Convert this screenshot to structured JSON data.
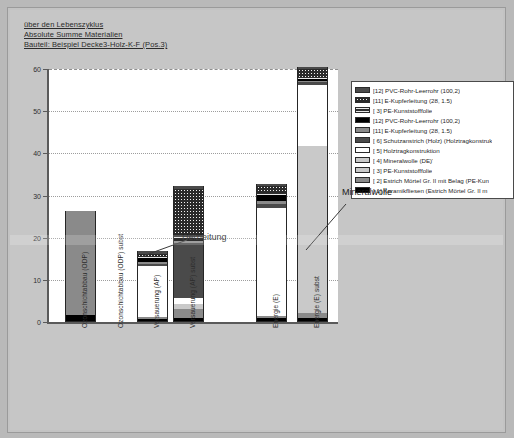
{
  "titles": [
    "über den Lebenszyklus",
    "Absolute Summe Materialien",
    "Bauteil: Beispiel Decke3-Holz-K-F (Pos.3)"
  ],
  "annotations": {
    "heizleitung": "Heizleitung",
    "mineralwolle": "Mineralwolle"
  },
  "legend": {
    "items": [
      {
        "label": "[12] PVC-Rohr-Leerrohr (100,2)",
        "fill": "f-dkgray"
      },
      {
        "label": "[11] E-Kupferleitung (28, 1.5)",
        "fill": "f-dots"
      },
      {
        "label": "[ 3] PE-Kunststofffolie",
        "fill": "f-hlines"
      },
      {
        "label": "[12] PVC-Rohr-Leerrohr (100,2)",
        "fill": "f-black"
      },
      {
        "label": "[11] E-Kupferleitung (28, 1.5)",
        "fill": "f-mgray"
      },
      {
        "label": "[ 6] Schutzanstrich (Holz) (Holztragkonstruk",
        "fill": "f-dkgray"
      },
      {
        "label": "[ 5] Holztragkonstruktion",
        "fill": "f-white"
      },
      {
        "label": "[ 4] Mineralwolle (DE)'",
        "fill": "f-lgray"
      },
      {
        "label": "[ 3] PE-Kunststofffolie",
        "fill": "f-lgray"
      },
      {
        "label": "[ 2] Estrich Mörtel Gr. II mit Belag (PE-Kun",
        "fill": "f-mgray"
      },
      {
        "label": "[ 1] Keramikfliesen (Estrich Mörtel Gr. II m",
        "fill": "f-black"
      }
    ]
  },
  "chart_data": {
    "type": "bar",
    "title": "Bauteil: Beispiel Decke3-Holz-K-F (Pos.3)",
    "subtitle": "Absolute Summe Materialien über den Lebenszyklus",
    "xlabel": "",
    "ylabel": "",
    "ylim": [
      0,
      60
    ],
    "yticks": [
      0,
      10,
      20,
      30,
      40,
      50,
      60
    ],
    "grid": true,
    "legend_position": "right",
    "stacked": true,
    "categories": [
      "Ozonschichtabbau (ODP)",
      "Ozonschichtabbau (ODP) subst",
      "Versauerung (AP)",
      "Versauerung (AP) subst",
      "Energie (E)",
      "Energie (E) subst"
    ],
    "series": [
      {
        "name": "[ 1] Keramikfliesen (Estrich Mörtel Gr. II m",
        "fill": "f-black",
        "values": [
          1.5,
          0,
          0.4,
          0.6,
          0.8,
          0.8
        ]
      },
      {
        "name": "[ 2] Estrich Mörtel Gr. II mit Belag (PE-Kun",
        "fill": "f-mgray",
        "values": [
          24.5,
          0,
          0.6,
          2.2,
          0.5,
          1.2
        ]
      },
      {
        "name": "[ 3] PE-Kunststofffolie",
        "fill": "f-lgray",
        "values": [
          0,
          0,
          0,
          0,
          0,
          0.4
        ]
      },
      {
        "name": "[ 4] Mineralwolle (DE)'",
        "fill": "f-lgray",
        "values": [
          0,
          0,
          0,
          1.2,
          0,
          39.0
        ]
      },
      {
        "name": "[ 5] Holztragkonstruktion",
        "fill": "f-white",
        "values": [
          0,
          0,
          12.0,
          1.4,
          25.5,
          14.6
        ]
      },
      {
        "name": "[ 6] Schutzanstrich (Holz) (Holztragkonstruk",
        "fill": "f-dkgray",
        "values": [
          0,
          0,
          0.6,
          13.0,
          1.0,
          0.6
        ]
      },
      {
        "name": "[11] E-Kupferleitung (28, 1.5)",
        "fill": "f-mgray",
        "values": [
          0,
          0,
          0.5,
          0.5,
          0.6,
          0.4
        ]
      },
      {
        "name": "[12] PVC-Rohr-Leerrohr (100,2)",
        "fill": "f-black",
        "values": [
          0,
          0,
          0.8,
          0.9,
          1.4,
          0.5
        ]
      },
      {
        "name": "[ 3] PE-Kunststofffolie",
        "fill": "f-hlines",
        "values": [
          0,
          0,
          0.4,
          0.5,
          0.6,
          0.4
        ]
      },
      {
        "name": "[11] E-Kupferleitung (28, 1.5)",
        "fill": "f-dots",
        "values": [
          0,
          0,
          0.6,
          11.0,
          1.6,
          1.8
        ]
      },
      {
        "name": "[12] PVC-Rohr-Leerrohr (100,2)",
        "fill": "f-dkgray",
        "values": [
          0,
          0,
          0.6,
          0.8,
          0.6,
          0.5
        ]
      }
    ],
    "totals": [
      26.0,
      0,
      16.5,
      32.1,
      32.6,
      60.2
    ]
  }
}
